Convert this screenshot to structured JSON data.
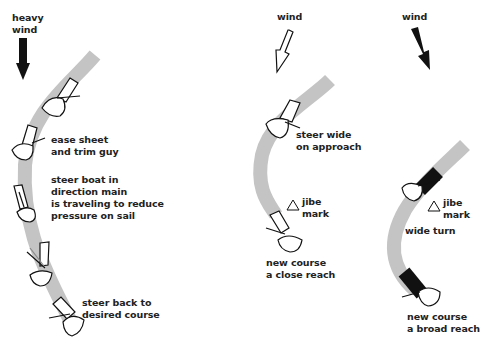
{
  "colors": {
    "track": "#c4c4c4",
    "ink": "#111111",
    "background": "#ffffff"
  },
  "panels": [
    {
      "id": "heavy-wind-jibe",
      "wind_label": "heavy\nwind",
      "wind_arrow": "solid-black-down",
      "notes": [
        "ease sheet\nand trim guy",
        "steer boat in\ndirection main\nis traveling to reduce\npressure on sail",
        "steer back to\ndesired course"
      ]
    },
    {
      "id": "close-reach-rounding",
      "wind_label": "wind",
      "wind_arrow": "outline-diagonal",
      "notes": [
        "steer wide\non approach",
        "jibe\nmark",
        "new course\na close reach"
      ]
    },
    {
      "id": "broad-reach-rounding",
      "wind_label": "wind",
      "wind_arrow": "solid-black-diagonal",
      "notes": [
        "jibe\nmark",
        "wide turn",
        "new course\na broad reach"
      ]
    }
  ]
}
